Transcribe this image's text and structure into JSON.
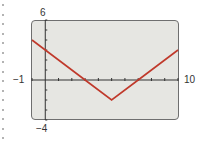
{
  "chart_data": {
    "type": "line",
    "title": "",
    "function": "y = |x - 5| - 2",
    "window": {
      "xmin": -1,
      "xmax": 10,
      "ymin": -4,
      "ymax": 6,
      "xscl": 1,
      "yscl": 1
    },
    "x": [
      -1,
      0,
      3,
      5,
      7,
      10
    ],
    "series": [
      {
        "name": "y1",
        "values": [
          4,
          3,
          0,
          -2,
          0,
          3
        ],
        "color": "#c0392b"
      }
    ],
    "tick_labels": {
      "xmin": "−1",
      "xmax": "10",
      "ymax": "6",
      "ymin": "−4"
    },
    "xlabel": "",
    "ylabel": "",
    "xlim": [
      -1,
      10
    ],
    "ylim": [
      -4,
      6
    ],
    "grid": false,
    "legend": "none"
  },
  "labels": {
    "ymax": "6",
    "ymin": "−4",
    "xmin": "−1",
    "xmax": "10"
  },
  "colors": {
    "screen": "#e6e6e2",
    "line": "#c0392b",
    "axis": "#333333"
  }
}
